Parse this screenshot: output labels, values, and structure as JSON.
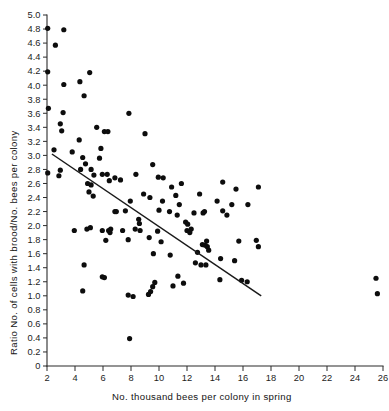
{
  "chart_data": {
    "type": "scatter",
    "title": "",
    "xlabel": "No. thousand bees per colony in spring",
    "ylabel": "Ratio No. of cells with brood/No. bees per colony",
    "xlim": [
      2,
      26
    ],
    "ylim": [
      0,
      5.0
    ],
    "grid": false,
    "legend": null,
    "xticks": [
      2,
      4,
      6,
      8,
      10,
      12,
      14,
      16,
      18,
      20,
      22,
      24,
      26
    ],
    "xtick_labels": [
      "2",
      "4",
      "6",
      "8",
      "10",
      "12",
      "14",
      "16",
      "18",
      "20",
      "22",
      "24",
      "26"
    ],
    "yticks": [
      0,
      0.2,
      0.4,
      0.6,
      0.8,
      1.0,
      1.2,
      1.4,
      1.6,
      1.8,
      2.0,
      2.2,
      2.4,
      2.6,
      2.8,
      3.0,
      3.2,
      3.4,
      3.6,
      3.8,
      4.0,
      4.2,
      4.4,
      4.6,
      4.8,
      5.0
    ],
    "ytick_labels": [
      "0",
      "0.2",
      "0.4",
      "0.6",
      "0.8",
      "1.0",
      "1.2",
      "1.4",
      "1.6",
      "1.8",
      "2.0",
      "2.2",
      "2.4",
      "2.6",
      "2.8",
      "3.0",
      "3.2",
      "3.4",
      "3.6",
      "3.8",
      "4.0",
      "4.2",
      "4.4",
      "4.6",
      "4.8",
      "5.0"
    ],
    "marker": "filled-circle",
    "marker_color": "#0d0d0d",
    "marker_size": 2.6,
    "trendline": {
      "type": "linear-fit",
      "color": "#1a1a1a",
      "x_start": 2.35,
      "y_start": 3.02,
      "x_end": 17.3,
      "y_end": 1.0
    },
    "points": [
      [
        2.05,
        4.81
      ],
      [
        3.2,
        4.79
      ],
      [
        2.6,
        4.57
      ],
      [
        2.05,
        4.19
      ],
      [
        5.05,
        4.18
      ],
      [
        4.35,
        4.05
      ],
      [
        3.2,
        4.01
      ],
      [
        4.65,
        3.85
      ],
      [
        2.1,
        3.67
      ],
      [
        3.15,
        3.61
      ],
      [
        7.85,
        3.6
      ],
      [
        2.95,
        3.45
      ],
      [
        5.55,
        3.4
      ],
      [
        6.1,
        3.34
      ],
      [
        6.35,
        3.34
      ],
      [
        3.05,
        3.35
      ],
      [
        9.0,
        3.31
      ],
      [
        4.3,
        3.22
      ],
      [
        5.85,
        3.1
      ],
      [
        2.5,
        3.08
      ],
      [
        3.8,
        3.05
      ],
      [
        4.55,
        2.97
      ],
      [
        5.75,
        2.96
      ],
      [
        4.75,
        2.88
      ],
      [
        9.55,
        2.87
      ],
      [
        2.05,
        2.75
      ],
      [
        5.15,
        2.8
      ],
      [
        4.4,
        2.8
      ],
      [
        5.35,
        2.72
      ],
      [
        5.95,
        2.73
      ],
      [
        6.3,
        2.73
      ],
      [
        8.35,
        2.73
      ],
      [
        9.95,
        2.69
      ],
      [
        10.3,
        2.68
      ],
      [
        2.85,
        2.71
      ],
      [
        6.85,
        2.68
      ],
      [
        2.95,
        2.79
      ],
      [
        6.45,
        2.64
      ],
      [
        7.25,
        2.65
      ],
      [
        10.9,
        2.55
      ],
      [
        4.9,
        2.6
      ],
      [
        5.15,
        2.58
      ],
      [
        11.6,
        2.6
      ],
      [
        5.0,
        2.48
      ],
      [
        5.3,
        2.42
      ],
      [
        8.9,
        2.45
      ],
      [
        9.35,
        2.4
      ],
      [
        11.2,
        2.43
      ],
      [
        7.95,
        2.35
      ],
      [
        10.25,
        2.35
      ],
      [
        11.45,
        2.3
      ],
      [
        12.9,
        2.45
      ],
      [
        6.85,
        2.2
      ],
      [
        6.95,
        2.2
      ],
      [
        7.6,
        2.21
      ],
      [
        10.0,
        2.22
      ],
      [
        10.75,
        2.2
      ],
      [
        11.3,
        2.15
      ],
      [
        12.5,
        2.18
      ],
      [
        13.15,
        2.18
      ],
      [
        13.25,
        2.2
      ],
      [
        8.55,
        2.09
      ],
      [
        8.6,
        2.03
      ],
      [
        11.9,
        2.05
      ],
      [
        12.05,
        2.02
      ],
      [
        3.95,
        1.93
      ],
      [
        4.85,
        1.95
      ],
      [
        5.1,
        1.97
      ],
      [
        5.95,
        1.93
      ],
      [
        6.4,
        1.93
      ],
      [
        6.5,
        1.9
      ],
      [
        6.55,
        1.95
      ],
      [
        7.4,
        1.93
      ],
      [
        8.3,
        1.95
      ],
      [
        8.65,
        1.93
      ],
      [
        9.9,
        1.92
      ],
      [
        12.0,
        1.93
      ],
      [
        12.2,
        1.9
      ],
      [
        12.3,
        1.95
      ],
      [
        13.4,
        1.78
      ],
      [
        6.2,
        1.79
      ],
      [
        7.8,
        1.8
      ],
      [
        9.3,
        1.83
      ],
      [
        10.15,
        1.77
      ],
      [
        13.1,
        1.73
      ],
      [
        13.3,
        1.72
      ],
      [
        13.45,
        1.7
      ],
      [
        9.6,
        1.6
      ],
      [
        10.8,
        1.58
      ],
      [
        12.75,
        1.62
      ],
      [
        13.55,
        1.65
      ],
      [
        12.6,
        1.47
      ],
      [
        13.0,
        1.44
      ],
      [
        13.35,
        1.44
      ],
      [
        4.65,
        1.44
      ],
      [
        11.35,
        1.28
      ],
      [
        5.95,
        1.27
      ],
      [
        6.1,
        1.26
      ],
      [
        11.75,
        1.18
      ],
      [
        9.7,
        1.19
      ],
      [
        9.55,
        1.13
      ],
      [
        9.4,
        1.06
      ],
      [
        9.25,
        1.02
      ],
      [
        11.0,
        1.14
      ],
      [
        7.8,
        1.01
      ],
      [
        8.15,
        0.99
      ],
      [
        4.55,
        1.07
      ],
      [
        7.9,
        0.39
      ],
      [
        14.55,
        2.62
      ],
      [
        15.5,
        2.52
      ],
      [
        17.1,
        2.55
      ],
      [
        14.15,
        2.35
      ],
      [
        15.2,
        2.3
      ],
      [
        16.35,
        2.3
      ],
      [
        14.85,
        2.15
      ],
      [
        14.55,
        2.21
      ],
      [
        15.7,
        1.78
      ],
      [
        16.95,
        1.79
      ],
      [
        17.1,
        1.7
      ],
      [
        14.4,
        1.53
      ],
      [
        15.4,
        1.5
      ],
      [
        14.35,
        1.23
      ],
      [
        15.9,
        1.22
      ],
      [
        16.3,
        1.2
      ],
      [
        25.5,
        1.25
      ],
      [
        25.6,
        1.03
      ]
    ]
  },
  "axes": {
    "x_axis_name": "No. thousand bees per colony in spring",
    "y_axis_name": "Ratio No. of cells with brood/No. bees per colony"
  }
}
